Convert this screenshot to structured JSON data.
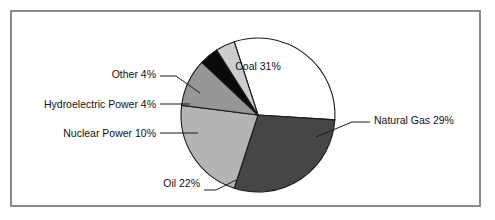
{
  "figure": {
    "frame_border_color": "#8a8a8a",
    "background_color": "#ffffff"
  },
  "chart_data": {
    "type": "pie",
    "title": "",
    "subtitle": "",
    "xlabel": "",
    "ylabel": "",
    "legend_position": "none",
    "grid": false,
    "units": "percent",
    "total": 100,
    "start_angle_deg": -18,
    "direction": "clockwise",
    "center": {
      "x": 258,
      "y": 115
    },
    "radius": 77,
    "categories": [
      "Coal",
      "Natural Gas",
      "Oil",
      "Nuclear Power",
      "Hydroelectric Power",
      "Other"
    ],
    "values": [
      31,
      29,
      22,
      10,
      4,
      4
    ],
    "colors": [
      "#ffffff",
      "#464646",
      "#b4b4b4",
      "#969696",
      "#0a0a0a",
      "#cdcdcd"
    ],
    "slices": [
      {
        "name": "Coal",
        "value": 31,
        "label": "Coal 31%",
        "color": "#ffffff",
        "label_placement": "inside",
        "label_x": 258,
        "label_y": 70,
        "label_anchor": "middle",
        "leader": null
      },
      {
        "name": "Natural Gas",
        "value": 29,
        "label": "Natural Gas 29%",
        "color": "#464646",
        "label_placement": "outside",
        "label_x": 374,
        "label_y": 124,
        "label_anchor": "start",
        "leader": "M 316 137 L 352 122 L 370 122"
      },
      {
        "name": "Oil",
        "value": 22,
        "label": "Oil 22%",
        "color": "#b4b4b4",
        "label_placement": "outside",
        "label_x": 200,
        "label_y": 187,
        "label_anchor": "end",
        "leader": "M 236 180 L 216 190 L 204 190"
      },
      {
        "name": "Nuclear Power",
        "value": 10,
        "label": "Nuclear Power 10%",
        "color": "#969696",
        "label_placement": "outside",
        "label_x": 156,
        "label_y": 137,
        "label_anchor": "end",
        "leader": "M 198 133 L 176 133 L 160 133"
      },
      {
        "name": "Hydroelectric Power",
        "value": 4,
        "label": "Hydroelectric Power 4%",
        "color": "#0a0a0a",
        "label_placement": "outside",
        "label_x": 156,
        "label_y": 108,
        "label_anchor": "end",
        "leader": "M 190 104 L 174 104 L 160 104"
      },
      {
        "name": "Other",
        "value": 4,
        "label": "Other 4%",
        "color": "#cdcdcd",
        "label_placement": "outside",
        "label_x": 156,
        "label_y": 78,
        "label_anchor": "end",
        "leader": "M 200 93 L 176 76 L 160 76"
      }
    ]
  }
}
